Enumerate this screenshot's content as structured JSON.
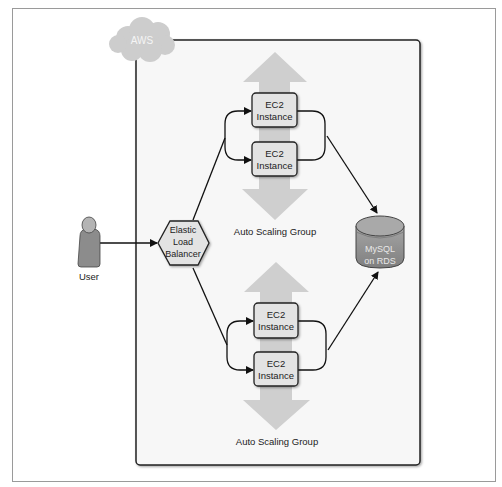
{
  "diagram": {
    "cloud": {
      "label": "AWS"
    },
    "user": {
      "label": "User"
    },
    "load_balancer": {
      "line1": "Elastic",
      "line2": "Load",
      "line3": "Balancer"
    },
    "database": {
      "line1": "MySQL",
      "line2": "on RDS"
    },
    "groups": [
      {
        "label": "Auto Scaling Group",
        "instances": [
          {
            "line1": "EC2",
            "line2": "Instance"
          },
          {
            "line1": "EC2",
            "line2": "Instance"
          }
        ]
      },
      {
        "label": "Auto Scaling Group",
        "instances": [
          {
            "line1": "EC2",
            "line2": "Instance"
          },
          {
            "line1": "EC2",
            "line2": "Instance"
          }
        ]
      }
    ],
    "colors": {
      "aws_box_fill": "#f7f7f7",
      "scaling_arrow": "#cfcfcf",
      "instance_fill": "#e3e3e3",
      "db_fill": "#8f8f8f",
      "user_fill": "#8c8c8c",
      "cloud_fill": "#cdcdcd"
    }
  }
}
